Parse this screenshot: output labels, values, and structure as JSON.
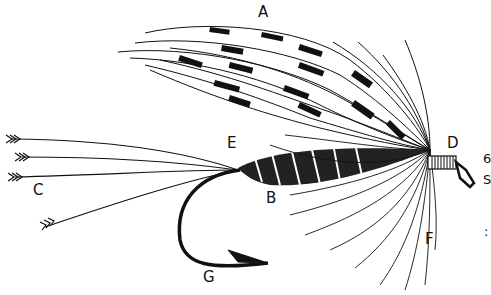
{
  "figure": {
    "title": "",
    "labels": [
      {
        "id": "A",
        "text": "A",
        "part": "wing",
        "x": 258,
        "y": 5
      },
      {
        "id": "B",
        "text": "B",
        "part": "body",
        "x": 266,
        "y": 191
      },
      {
        "id": "C",
        "text": "C",
        "part": "tail",
        "x": 33,
        "y": 183
      },
      {
        "id": "D",
        "text": "D",
        "part": "head",
        "x": 447,
        "y": 136
      },
      {
        "id": "E",
        "text": "E",
        "part": "tag",
        "x": 227,
        "y": 136
      },
      {
        "id": "F",
        "text": "F",
        "part": "hackle",
        "x": 425,
        "y": 232
      },
      {
        "id": "G",
        "text": "G",
        "part": "hook",
        "x": 203,
        "y": 270
      }
    ],
    "edge_fragments": [
      {
        "text": "6",
        "x": 483,
        "y": 152
      },
      {
        "text": "S",
        "x": 483,
        "y": 173
      },
      {
        "text": ":",
        "x": 484,
        "y": 225
      }
    ],
    "colors": {
      "ink": "#111111",
      "paper": "#ffffff"
    }
  }
}
